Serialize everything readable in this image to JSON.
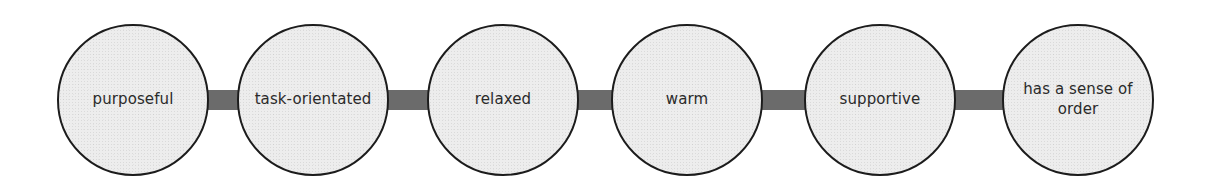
{
  "diagram": {
    "type": "linear-chain",
    "background_color": "#ffffff",
    "node_fill_color": "#ededed",
    "node_border_color": "#1c1c1c",
    "connector_color": "#6b6b6b",
    "label_color": "#2a2a2a",
    "nodes": [
      {
        "label": "purposeful",
        "cx": 133,
        "cy": 100,
        "r": 76
      },
      {
        "label": "task-orientated",
        "cx": 313,
        "cy": 100,
        "r": 76
      },
      {
        "label": "relaxed",
        "cx": 503,
        "cy": 100,
        "r": 76
      },
      {
        "label": "warm",
        "cx": 687,
        "cy": 100,
        "r": 76
      },
      {
        "label": "supportive",
        "cx": 880,
        "cy": 100,
        "r": 76
      },
      {
        "label": "has a sense of order",
        "cx": 1078,
        "cy": 100,
        "r": 76
      }
    ],
    "connectors": [
      {
        "from": "purposeful",
        "to": "task-orientated",
        "x": 203,
        "width": 114
      },
      {
        "from": "task-orientated",
        "to": "relaxed",
        "x": 383,
        "width": 124
      },
      {
        "from": "relaxed",
        "to": "warm",
        "x": 573,
        "width": 118
      },
      {
        "from": "warm",
        "to": "supportive",
        "x": 757,
        "width": 127
      },
      {
        "from": "supportive",
        "to": "has a sense of order",
        "x": 950,
        "width": 132
      }
    ]
  }
}
